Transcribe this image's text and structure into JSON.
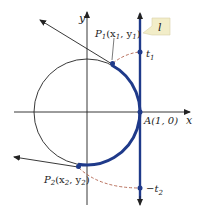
{
  "diagram": {
    "axes": {
      "x_label": "x",
      "y_label": "y"
    },
    "points": {
      "P1": {
        "label": "P",
        "sub": "1",
        "coords_open": "(x",
        "x_sub": "1",
        "comma": ", y",
        "y_sub": "1",
        "close": ")"
      },
      "P2": {
        "label": "P",
        "sub": "2",
        "coords_open": "(x",
        "x_sub": "2",
        "comma": ", y",
        "y_sub": "2",
        "close": ")"
      },
      "A": {
        "label": "A(1, 0)"
      }
    },
    "tangent_marks": {
      "t1": {
        "label": "t",
        "sub": "1"
      },
      "neg_t2": {
        "label": "−t",
        "sub": "2"
      }
    },
    "line_tag": {
      "label": "l"
    },
    "colors": {
      "arc": "#1f3a8a",
      "tangent_line": "#1f3a8a",
      "dashed": "#b0604a",
      "axes": "#222222",
      "tag_bg": "#f2edc8"
    }
  }
}
